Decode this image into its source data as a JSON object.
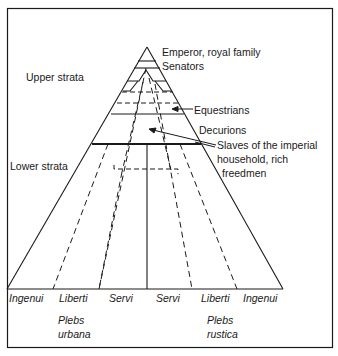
{
  "diagram": {
    "left_labels": {
      "upper": "Upper strata",
      "lower": "Lower strata"
    },
    "right_labels": {
      "emperor": "Emperor, royal family",
      "senators": "Senators",
      "equestrians": "Equestrians",
      "decurions": "Decurions",
      "slaves_line1": "Slaves of the imperial",
      "slaves_line2": "household, rich",
      "slaves_line3": "freedmen"
    },
    "base_labels": [
      "Ingenui",
      "Liberti",
      "Servi",
      "Servi",
      "Liberti",
      "Ingenui"
    ],
    "groups": {
      "urbana_line1": "Plebs",
      "urbana_line2": "urbana",
      "rustica_line1": "Plebs",
      "rustica_line2": "rustica"
    },
    "colors": {
      "line": "#1a1a1a",
      "background": "#ffffff"
    }
  }
}
